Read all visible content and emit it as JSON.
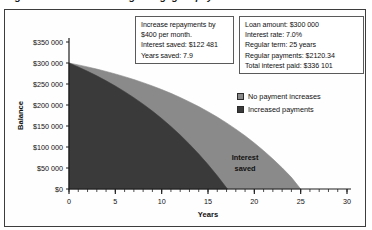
{
  "title": "Figure: Effect of increasing mortgage repayments",
  "chart_data": {
    "type": "area",
    "title": "",
    "xlabel": "Years",
    "ylabel": "Balance",
    "xlim": [
      0,
      30
    ],
    "ylim": [
      0,
      350000
    ],
    "grid": false,
    "legend_position": "right",
    "xticks": [
      0,
      5,
      10,
      15,
      20,
      25,
      30
    ],
    "xticklabels": [
      "0",
      "5",
      "10",
      "15",
      "20",
      "25",
      "30"
    ],
    "xminor_tick_interval": 1,
    "yticks": [
      0,
      50000,
      100000,
      150000,
      200000,
      250000,
      300000,
      350000
    ],
    "yticklabels": [
      "$0",
      "$50 000",
      "$100 000",
      "$150 000",
      "$200 000",
      "$250 000",
      "$300 000",
      "$350 000"
    ],
    "annotations": [
      {
        "text_line1": "Interest",
        "text_line2": "saved",
        "x": 19.0,
        "y": 68000
      }
    ],
    "series": [
      {
        "name": "No payment increases",
        "color": "#8a8a8a",
        "x": [
          0,
          1,
          2,
          3,
          4,
          5,
          6,
          7,
          8,
          9,
          10,
          11,
          12,
          13,
          14,
          15,
          16,
          17,
          18,
          19,
          20,
          21,
          22,
          23,
          24,
          25
        ],
        "values": [
          300000,
          295500,
          290700,
          285500,
          279900,
          273900,
          267500,
          260600,
          253200,
          245300,
          236800,
          227700,
          217900,
          207400,
          196200,
          184100,
          171200,
          157400,
          142500,
          126600,
          109500,
          91200,
          71500,
          50400,
          27700,
          0
        ]
      },
      {
        "name": "Increased payments",
        "color": "#3a3a3a",
        "x": [
          0,
          1,
          2,
          3,
          4,
          5,
          6,
          7,
          8,
          9,
          10,
          11,
          12,
          13,
          14,
          15,
          16,
          17.1
        ],
        "values": [
          300000,
          290500,
          280300,
          269400,
          257700,
          245200,
          231800,
          217400,
          202000,
          185500,
          167800,
          148800,
          128500,
          106700,
          83300,
          58300,
          31500,
          0
        ]
      }
    ]
  },
  "assumption_box": {
    "lines": [
      "Increase repayments by",
      "$400 per month.",
      "Interest saved: $122 481",
      "Years saved: 7.9"
    ]
  },
  "loan_box": {
    "lines": [
      "Loan amount:  $300 000",
      "Interest rate:  7.0%",
      "Regular term: 25 years",
      "Regular payments: $2120.34",
      "Total interest paid: $336 101"
    ]
  },
  "legend": {
    "items": [
      {
        "label": "No payment increases",
        "color": "#8a8a8a"
      },
      {
        "label": "Increased payments",
        "color": "#3a3a3a"
      }
    ]
  }
}
